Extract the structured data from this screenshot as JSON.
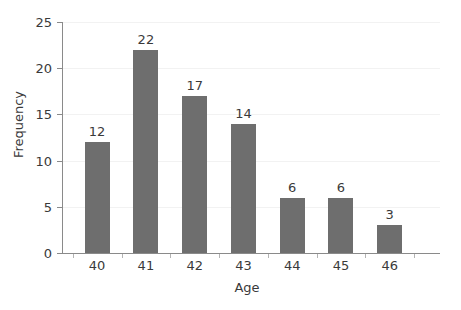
{
  "chart_data": {
    "type": "bar",
    "title": "",
    "xlabel": "Age",
    "ylabel": "Frequency",
    "categories": [
      "40",
      "41",
      "42",
      "43",
      "44",
      "45",
      "46"
    ],
    "values": [
      12,
      22,
      17,
      14,
      6,
      6,
      3
    ],
    "data_labels": [
      "12",
      "22",
      "17",
      "14",
      "6",
      "6",
      "3"
    ],
    "ylim": [
      0,
      25
    ],
    "y_ticks": [
      0,
      5,
      10,
      15,
      20,
      25
    ],
    "y_tick_labels": [
      "0",
      "5",
      "10",
      "15",
      "20",
      "25"
    ],
    "grid": true,
    "grid_axis": "y",
    "legend": false,
    "legend_position": "none",
    "bar_color": "#6e6e6e",
    "background_color": "#ffffff",
    "text_color": "#3a3a3a",
    "axis_color": "#8a8a8a",
    "grid_color": "#f2f2f2"
  }
}
